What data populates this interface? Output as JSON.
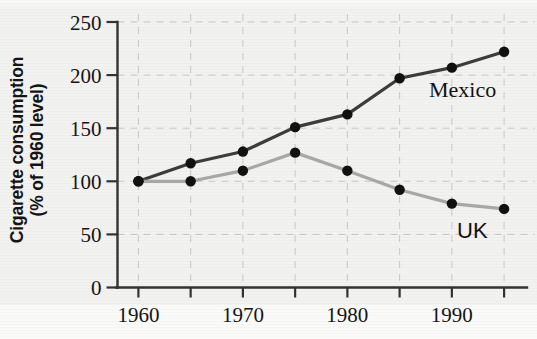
{
  "figure": {
    "background_color": "#f2f2f0",
    "axis_color": "#333333",
    "gridline_color": "#c8c8c4"
  },
  "chart_data": {
    "type": "line",
    "title": "",
    "xlabel": "",
    "ylabel": "Cigarette consumption (% of 1960 level)",
    "ylabel_lines": [
      "Cigarette consumption",
      "(% of 1960 level)"
    ],
    "x": [
      1960,
      1965,
      1970,
      1975,
      1980,
      1985,
      1990,
      1995
    ],
    "xlim": [
      1958,
      1997
    ],
    "ylim": [
      0,
      250
    ],
    "x_major_ticks": [
      1960,
      1970,
      1980,
      1990
    ],
    "x_major_tick_labels": [
      "1960",
      "1970",
      "1980",
      "1990"
    ],
    "x_minor_ticks": [
      1965,
      1975,
      1985,
      1995
    ],
    "y_ticks": [
      0,
      50,
      100,
      150,
      200,
      250
    ],
    "y_tick_labels": [
      "0",
      "50",
      "100",
      "150",
      "200",
      "250"
    ],
    "grid": "dashed gridlines on both axes",
    "legend": "inline series labels at right of each line",
    "series": [
      {
        "name": "Mexico",
        "color": "#3c3c3c",
        "marker": "filled-circle",
        "marker_color": "#111111",
        "label_position": "right of 1985-1990 segment",
        "values": [
          100,
          117,
          128,
          151,
          163,
          197,
          207,
          222
        ]
      },
      {
        "name": "UK",
        "color": "#a8a8a8",
        "marker": "filled-circle",
        "marker_color": "#111111",
        "label_position": "below 1995 endpoint",
        "values": [
          100,
          100,
          110,
          127,
          110,
          92,
          79,
          74
        ]
      }
    ]
  }
}
